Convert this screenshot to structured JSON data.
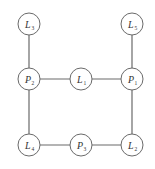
{
  "diagram": {
    "type": "graph",
    "nodes": [
      {
        "id": "L3",
        "letter": "L",
        "sub": "3",
        "x": 29,
        "y": 24
      },
      {
        "id": "L5",
        "letter": "L",
        "sub": "5",
        "x": 132,
        "y": 24
      },
      {
        "id": "P2",
        "letter": "P",
        "sub": "2",
        "x": 29,
        "y": 79
      },
      {
        "id": "L1",
        "letter": "L",
        "sub": "1",
        "x": 81,
        "y": 79
      },
      {
        "id": "P1",
        "letter": "P",
        "sub": "1",
        "x": 132,
        "y": 79
      },
      {
        "id": "L4",
        "letter": "L",
        "sub": "4",
        "x": 29,
        "y": 145
      },
      {
        "id": "P3",
        "letter": "P",
        "sub": "3",
        "x": 81,
        "y": 145
      },
      {
        "id": "L2",
        "letter": "L",
        "sub": "2",
        "x": 132,
        "y": 145
      }
    ],
    "edges": [
      [
        "L3",
        "P2"
      ],
      [
        "L5",
        "P1"
      ],
      [
        "P2",
        "L1"
      ],
      [
        "L1",
        "P1"
      ],
      [
        "P2",
        "L4"
      ],
      [
        "P1",
        "L2"
      ],
      [
        "L4",
        "P3"
      ],
      [
        "P3",
        "L2"
      ]
    ],
    "node_radius": 11,
    "colors": {
      "stroke": "#6a6a6a",
      "fill": "#ffffff",
      "text": "#333333"
    }
  }
}
